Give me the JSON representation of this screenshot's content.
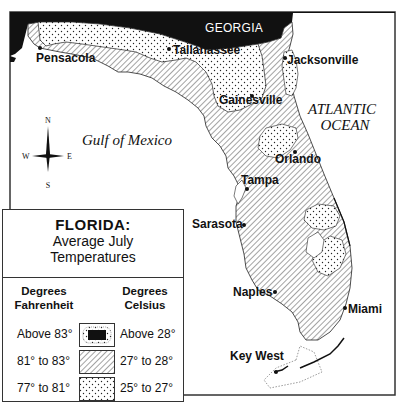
{
  "map": {
    "state_label": "GEORGIA",
    "water_labels": {
      "gulf": "Gulf of Mexico",
      "atlantic_line1": "ATLANTIC",
      "atlantic_line2": "OCEAN"
    },
    "compass": {
      "n": "N",
      "s": "S",
      "e": "E",
      "w": "W"
    },
    "cities": [
      {
        "name": "Pensacola"
      },
      {
        "name": "Tallahassee"
      },
      {
        "name": "Jacksonville"
      },
      {
        "name": "Gainesville"
      },
      {
        "name": "Orlando"
      },
      {
        "name": "Tampa"
      },
      {
        "name": "Sarasota"
      },
      {
        "name": "Naples"
      },
      {
        "name": "Miami"
      },
      {
        "name": "Key West"
      }
    ]
  },
  "legend": {
    "title": "FLORIDA:",
    "subtitle_line1": "Average July",
    "subtitle_line2": "Temperatures",
    "header_f_line1": "Degrees",
    "header_f_line2": "Fahrenheit",
    "header_c_line1": "Degrees",
    "header_c_line2": "Celsius",
    "rows": [
      {
        "fahrenheit": "Above 83°",
        "celsius": "Above 28°",
        "pattern": "solid-black"
      },
      {
        "fahrenheit": "81° to 83°",
        "celsius": "27° to 28°",
        "pattern": "diagonal-hatch"
      },
      {
        "fahrenheit": "77° to 81°",
        "celsius": "25° to 27°",
        "pattern": "dotted"
      }
    ]
  },
  "colors": {
    "ink": "#111111",
    "paper": "#ffffff"
  }
}
